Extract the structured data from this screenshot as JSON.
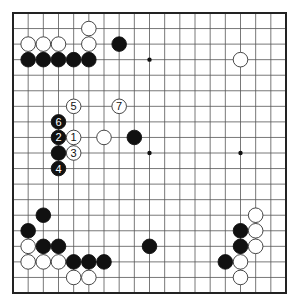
{
  "diagram": {
    "type": "go-board",
    "size": 19,
    "colors": {
      "line": "#555555",
      "border": "#222222",
      "black": "#111111",
      "white": "#ffffff",
      "label_on_black": "#ffffff",
      "label_on_white": "#111111"
    },
    "star_points": [
      [
        3,
        3
      ],
      [
        9,
        3
      ],
      [
        15,
        3
      ],
      [
        3,
        9
      ],
      [
        9,
        9
      ],
      [
        15,
        9
      ],
      [
        3,
        15
      ],
      [
        9,
        15
      ],
      [
        15,
        15
      ]
    ],
    "stones": [
      {
        "c": 5,
        "r": 1,
        "color": "white"
      },
      {
        "c": 1,
        "r": 2,
        "color": "white"
      },
      {
        "c": 2,
        "r": 2,
        "color": "white"
      },
      {
        "c": 3,
        "r": 2,
        "color": "white"
      },
      {
        "c": 5,
        "r": 2,
        "color": "white"
      },
      {
        "c": 7,
        "r": 2,
        "color": "black"
      },
      {
        "c": 1,
        "r": 3,
        "color": "black"
      },
      {
        "c": 2,
        "r": 3,
        "color": "black"
      },
      {
        "c": 3,
        "r": 3,
        "color": "black"
      },
      {
        "c": 4,
        "r": 3,
        "color": "black"
      },
      {
        "c": 5,
        "r": 3,
        "color": "black"
      },
      {
        "c": 15,
        "r": 3,
        "color": "white"
      },
      {
        "c": 4,
        "r": 6,
        "color": "white",
        "label": "5"
      },
      {
        "c": 7,
        "r": 6,
        "color": "white",
        "label": "7"
      },
      {
        "c": 3,
        "r": 7,
        "color": "black",
        "label": "6"
      },
      {
        "c": 3,
        "r": 8,
        "color": "black",
        "label": "2"
      },
      {
        "c": 4,
        "r": 8,
        "color": "white",
        "label": "1"
      },
      {
        "c": 6,
        "r": 8,
        "color": "white"
      },
      {
        "c": 8,
        "r": 8,
        "color": "black"
      },
      {
        "c": 3,
        "r": 9,
        "color": "black"
      },
      {
        "c": 4,
        "r": 9,
        "color": "white",
        "label": "3"
      },
      {
        "c": 3,
        "r": 10,
        "color": "black",
        "label": "4"
      },
      {
        "c": 2,
        "r": 13,
        "color": "black"
      },
      {
        "c": 1,
        "r": 14,
        "color": "black"
      },
      {
        "c": 1,
        "r": 15,
        "color": "white"
      },
      {
        "c": 2,
        "r": 15,
        "color": "black"
      },
      {
        "c": 3,
        "r": 15,
        "color": "black"
      },
      {
        "c": 9,
        "r": 15,
        "color": "black"
      },
      {
        "c": 1,
        "r": 16,
        "color": "white"
      },
      {
        "c": 2,
        "r": 16,
        "color": "white"
      },
      {
        "c": 3,
        "r": 16,
        "color": "white"
      },
      {
        "c": 4,
        "r": 16,
        "color": "black"
      },
      {
        "c": 5,
        "r": 16,
        "color": "black"
      },
      {
        "c": 6,
        "r": 16,
        "color": "black"
      },
      {
        "c": 4,
        "r": 17,
        "color": "white"
      },
      {
        "c": 5,
        "r": 17,
        "color": "white"
      },
      {
        "c": 16,
        "r": 13,
        "color": "white"
      },
      {
        "c": 15,
        "r": 14,
        "color": "black"
      },
      {
        "c": 16,
        "r": 14,
        "color": "white"
      },
      {
        "c": 15,
        "r": 15,
        "color": "black"
      },
      {
        "c": 16,
        "r": 15,
        "color": "white"
      },
      {
        "c": 14,
        "r": 16,
        "color": "black"
      },
      {
        "c": 15,
        "r": 16,
        "color": "white"
      },
      {
        "c": 15,
        "r": 17,
        "color": "white"
      }
    ]
  }
}
